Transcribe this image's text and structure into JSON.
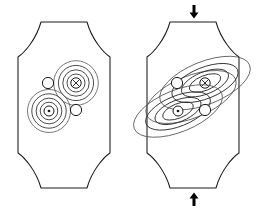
{
  "figure": {
    "background_color": "#ffffff",
    "line_color": "#1a1a1a",
    "contour_color": "#2b2b2b"
  },
  "panels": [
    {
      "id": "left",
      "name": "unstrained-panel",
      "label": "",
      "strained": false,
      "arrows": [],
      "cores": [
        {
          "id": "upper-core",
          "name": "crossed-circle-core",
          "symbol": "circle-with-x",
          "polarity": "into-page",
          "cx": 76,
          "cy": 83,
          "radii": [
            5.2,
            9.0,
            13.2,
            17.6,
            22.3
          ],
          "shape": "circular"
        },
        {
          "id": "lower-core",
          "name": "dotted-circle-core",
          "symbol": "circle-with-dot",
          "polarity": "out-of-page",
          "cx": 49,
          "cy": 111,
          "radii": [
            5.0,
            8.8,
            12.9,
            17.2,
            21.5
          ],
          "shape": "circular"
        }
      ],
      "plain_circles": [
        {
          "id": "pin-a",
          "name": "pinning-site-upper-left",
          "cx": 48,
          "cy": 83,
          "r": 5.6
        },
        {
          "id": "pin-b",
          "name": "pinning-site-lower-right",
          "cx": 76,
          "cy": 110,
          "r": 5.6
        }
      ]
    },
    {
      "id": "right",
      "name": "compressed-panel",
      "label": "",
      "strained": true,
      "arrows": [
        {
          "id": "arrow-top",
          "name": "compression-arrow-top",
          "direction": "down",
          "x": 194,
          "y": 12
        },
        {
          "id": "arrow-bottom",
          "name": "compression-arrow-bottom",
          "direction": "up",
          "x": 194,
          "y": 199
        }
      ],
      "cores": [
        {
          "id": "upper-core",
          "name": "crossed-circle-core",
          "symbol": "circle-with-x",
          "polarity": "into-page",
          "cx": 205,
          "cy": 83,
          "radii": [
            5.2,
            9.0,
            13.5,
            19.0,
            26.0
          ],
          "shape": "elliptical",
          "elongation": 1.85,
          "rotation_deg": -22
        },
        {
          "id": "lower-core",
          "name": "dotted-circle-core",
          "symbol": "circle-with-dot",
          "polarity": "out-of-page",
          "cx": 178,
          "cy": 111,
          "radii": [
            5.0,
            8.8,
            13.2,
            18.6,
            25.5
          ],
          "shape": "elliptical",
          "elongation": 1.85,
          "rotation_deg": -22
        }
      ],
      "plain_circles": [
        {
          "id": "pin-a",
          "name": "pinning-site-upper-left",
          "cx": 177,
          "cy": 83,
          "r": 5.6
        },
        {
          "id": "pin-b",
          "name": "pinning-site-lower-right",
          "cx": 205,
          "cy": 110,
          "r": 5.6
        }
      ]
    }
  ],
  "outline": {
    "name": "cushion-domain-outline",
    "top_flat_half_width": 23,
    "top_y": 22,
    "side_half_width": 46,
    "shoulder_y": 57,
    "waist_y": 153,
    "bottom_y": 188,
    "bottom_flat_half_width": 23
  }
}
